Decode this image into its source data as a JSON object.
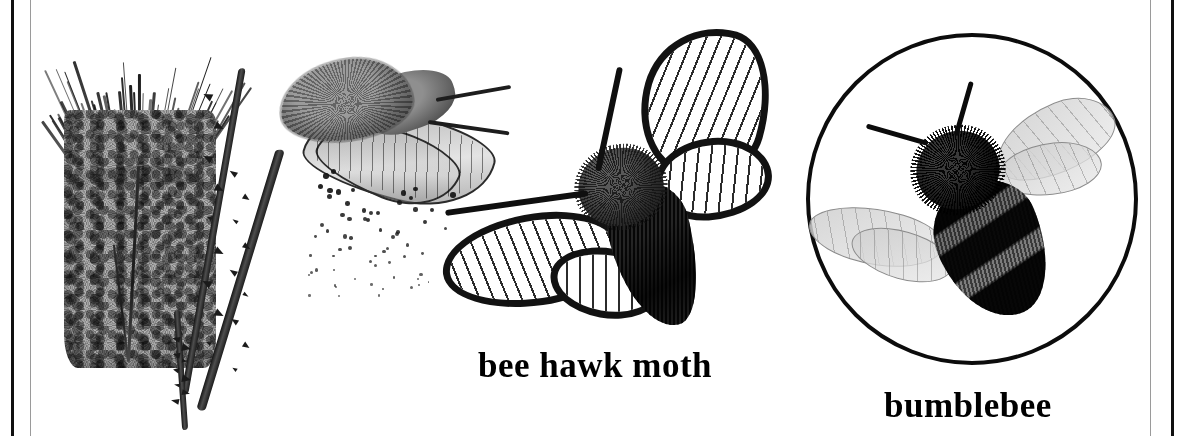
{
  "page": {
    "background_color": "#ffffff",
    "width": 1177,
    "height": 436
  },
  "borders": {
    "left_outer_rule_color": "#101010",
    "left_inner_rule_color": "#9a9a9a",
    "right_inner_rule_color": "#9a9a9a",
    "right_outer_rule_color": "#101010"
  },
  "figures": {
    "thistle": {
      "name": "thistle-flower-head-with-spiny-stems",
      "head_color": "#9d9d9d",
      "bristle_color": "#1b1b1b",
      "stem_color": "#1d1d1d"
    },
    "grey_moth": {
      "name": "grey-moth-shedding-scales",
      "body_color": "#6b6b6b",
      "wing_color": "#b4b4b4",
      "scale_dot_color": "#161616"
    },
    "bee_hawk_moth": {
      "name": "bee-hawk-moth",
      "body_color": "#141414",
      "wing_fill_color": "#ffffff",
      "wing_border_color": "#121212",
      "vein_color": "#191919"
    },
    "bumblebee": {
      "name": "bumblebee-in-circle",
      "circle_stroke_color": "#0c0c0c",
      "body_color": "#050505",
      "band_color": "#7d7d7d",
      "wing_color": "#cdcdcd"
    }
  },
  "captions": {
    "bee_hawk_moth": "bee hawk moth",
    "bumblebee": "bumblebee"
  }
}
